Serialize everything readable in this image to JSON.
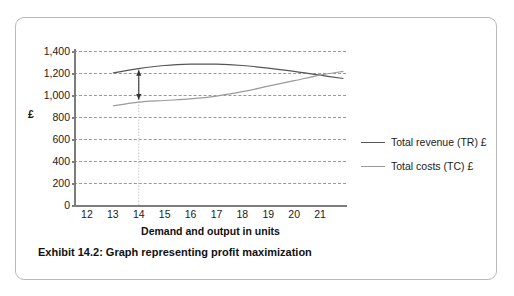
{
  "caption": "Exhibit 14.2:  Graph representing profit maximization",
  "legend": {
    "items": [
      {
        "label": "Total revenue (TR) £",
        "color": "#555555",
        "key": "TR"
      },
      {
        "label": "Total costs (TC) £",
        "color": "#9b9b9b",
        "key": "TC"
      }
    ]
  },
  "chart_data": {
    "type": "line",
    "title": "",
    "xlabel": "Demand and output in units",
    "ylabel": "£",
    "xlim": [
      11.5,
      22.0
    ],
    "ylim": [
      0,
      1400
    ],
    "grid": true,
    "legend_position": "right",
    "xticks": [
      12,
      13,
      14,
      15,
      16,
      17,
      18,
      19,
      20,
      21
    ],
    "xtick_labels": [
      "12",
      "13",
      "14",
      "15",
      "16",
      "17",
      "18",
      "19",
      "20",
      "21"
    ],
    "yticks": [
      0,
      200,
      400,
      600,
      800,
      1000,
      1200,
      1400
    ],
    "ytick_labels": [
      "0",
      "200",
      "400",
      "600",
      "800",
      "1,000",
      "1,200",
      "1,400"
    ],
    "series": [
      {
        "name": "Total revenue (TR) £",
        "color": "#555555",
        "x": [
          13,
          14,
          15,
          16,
          17,
          18,
          19,
          20,
          21,
          21.9
        ],
        "values": [
          1200,
          1240,
          1268,
          1280,
          1280,
          1268,
          1245,
          1215,
          1180,
          1150
        ]
      },
      {
        "name": "Total costs (TC) £",
        "color": "#9b9b9b",
        "x": [
          13,
          14,
          15,
          16,
          17,
          18,
          19,
          20,
          21,
          21.9
        ],
        "values": [
          900,
          935,
          950,
          965,
          990,
          1030,
          1080,
          1130,
          1180,
          1215
        ]
      }
    ],
    "annotations": [
      {
        "type": "vertical-dotted-line",
        "x": 14,
        "y_from": 0,
        "y_to": 1240,
        "color": "#c8c8c8"
      },
      {
        "type": "double-arrow",
        "label": "profit gap at output 14",
        "x": 14,
        "y_top": 1225,
        "y_bottom": 960,
        "color": "#333333"
      },
      {
        "type": "crossover",
        "label": "TR = TC break-even",
        "x": 21.4,
        "y": 1193
      }
    ]
  }
}
